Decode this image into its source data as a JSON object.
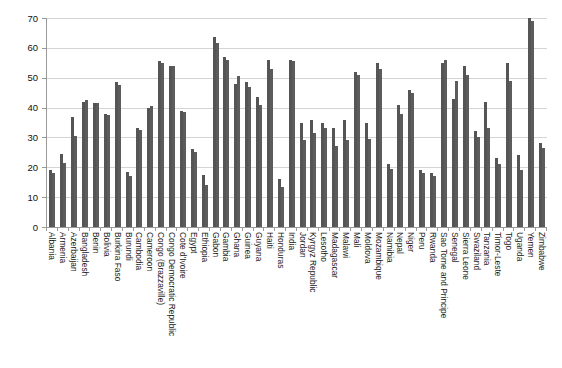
{
  "chart_data": {
    "type": "bar",
    "title": "",
    "subtitle": "",
    "xlabel": "",
    "ylabel": "",
    "ylim": [
      0,
      70
    ],
    "yticks": [
      0,
      10,
      20,
      30,
      40,
      50,
      60,
      70
    ],
    "grid": true,
    "legend": "none",
    "bar_color": "#555555",
    "bar_color_secondary": "#5c5c5c",
    "axis_color": "#9a9a9a",
    "gridline_color": "#d4d4d4",
    "categories": [
      "Albania",
      "Armenia",
      "Azerbaijan",
      "Bangladesh",
      "Benin",
      "Bolivia",
      "Burkina Faso",
      "Burundi",
      "Cambodia",
      "Cameroon",
      "Congo (Brazzaville)",
      "Congo Democratic Republic",
      "Cote d'Ivoire",
      "Egypt",
      "Ethiopia",
      "Gabon",
      "Gambia",
      "Ghana",
      "Guinea",
      "Guyana",
      "Haiti",
      "Honduras",
      "India",
      "Jordan",
      "Kyrgyz Republic",
      "Lesotho",
      "Madagascar",
      "Malawi",
      "Mali",
      "Moldova",
      "Mozambique",
      "Namibia",
      "Nepal",
      "Niger",
      "Peru",
      "Rwanda",
      "Sao Tome and Principe",
      "Senegal",
      "Sierra Leone",
      "Swaziland",
      "Tanzania",
      "Timor-Leste",
      "Togo",
      "Uganda",
      "Yemen",
      "Zimbabwe"
    ],
    "series": [
      {
        "name": "Series 1",
        "values": [
          19.0,
          24.5,
          37.0,
          42.0,
          41.5,
          38.0,
          48.5,
          18.5,
          33.0,
          40.0,
          55.5,
          54.0,
          39.0,
          26.0,
          17.5,
          63.5,
          57.0,
          48.0,
          48.5,
          43.5,
          56.0,
          16.0,
          56.0,
          35.0,
          36.0,
          35.0,
          33.0,
          36.0,
          52.0,
          35.0,
          55.0,
          21.0,
          41.0,
          46.0,
          19.0,
          18.0,
          55.0,
          43.0,
          54.0,
          32.0,
          42.0,
          23.0,
          55.0,
          24.0,
          70.0,
          28.0
        ]
      },
      {
        "name": "Series 2",
        "values": [
          18.0,
          21.5,
          30.5,
          42.5,
          41.5,
          37.5,
          47.5,
          17.0,
          32.5,
          40.5,
          55.0,
          54.0,
          38.5,
          25.0,
          14.0,
          61.5,
          56.0,
          50.5,
          47.0,
          41.0,
          53.0,
          13.5,
          55.5,
          29.0,
          31.5,
          33.0,
          27.0,
          29.0,
          51.0,
          29.5,
          53.0,
          19.5,
          38.0,
          45.0,
          18.0,
          17.0,
          56.0,
          49.0,
          51.0,
          30.0,
          33.0,
          21.0,
          49.0,
          19.0,
          69.0,
          26.5
        ]
      }
    ]
  }
}
